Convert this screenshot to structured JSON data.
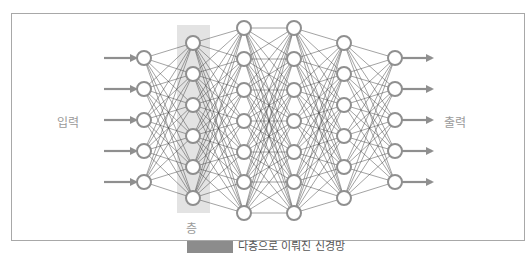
{
  "diagram": {
    "labels": {
      "input": "입력",
      "output": "출력",
      "layer": "층"
    },
    "caption": {
      "tag": "",
      "text": "다층으로 이뤄진 신경망"
    },
    "colors": {
      "node_stroke": "#8f8f8f",
      "edge": "#4a4a4a",
      "arrow": "#8f8f8f",
      "highlight": "#e3e3e3",
      "frame": "#a8a8a8",
      "label": "#9a9a9a"
    },
    "layers": [
      {
        "x": 144,
        "ys": [
          58,
          89,
          120,
          151,
          182
        ],
        "role": "input"
      },
      {
        "x": 193,
        "ys": [
          43,
          74,
          105,
          136,
          167,
          198
        ],
        "role": "hidden",
        "highlighted": true
      },
      {
        "x": 244,
        "ys": [
          28,
          59,
          90,
          121,
          152,
          182,
          213
        ],
        "role": "hidden"
      },
      {
        "x": 294,
        "ys": [
          28,
          59,
          90,
          121,
          152,
          182,
          213
        ],
        "role": "hidden"
      },
      {
        "x": 344,
        "ys": [
          43,
          74,
          105,
          136,
          167,
          198
        ],
        "role": "hidden"
      },
      {
        "x": 395,
        "ys": [
          58,
          89,
          120,
          151,
          182
        ],
        "role": "output"
      }
    ],
    "node_radius": 7,
    "input_arrows": {
      "x_start": 104,
      "x_end": 136
    },
    "output_arrows": {
      "x_start": 402,
      "x_end": 432
    },
    "highlight_box": {
      "x": 177,
      "y": 25,
      "w": 33,
      "h": 188
    }
  }
}
